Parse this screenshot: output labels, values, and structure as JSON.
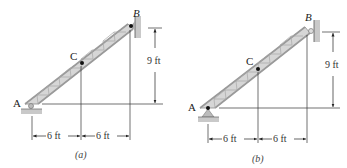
{
  "figures": [
    {
      "caption": "(a)",
      "points": {
        "A": "A",
        "B": "B",
        "C": "C"
      },
      "support_A": "roller",
      "support_B": "pin on wall",
      "dimensions": {
        "vertical": "9 ft",
        "horizontal_left": "6 ft",
        "horizontal_right": "6 ft"
      }
    },
    {
      "caption": "(b)",
      "points": {
        "A": "A",
        "B": "B",
        "C": "C"
      },
      "support_A": "pin",
      "support_B": "roller on wall",
      "dimensions": {
        "vertical": "9 ft",
        "horizontal_left": "6 ft",
        "horizontal_right": "6 ft"
      }
    }
  ],
  "colors": {
    "truss": "#b9b9b9",
    "truss_edge": "#8c8c8c",
    "ground": "#c9c9c9",
    "line": "#222222"
  }
}
